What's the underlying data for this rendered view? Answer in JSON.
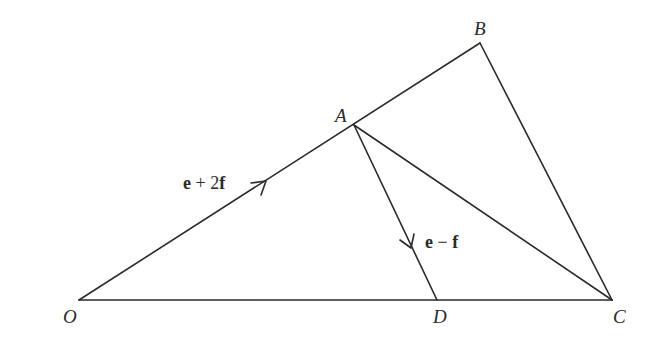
{
  "diagram": {
    "points": {
      "O": {
        "label": "O",
        "x": 79,
        "y": 300,
        "label_x": 63,
        "label_y": 323
      },
      "A": {
        "label": "A",
        "x": 354,
        "y": 125,
        "label_x": 335,
        "label_y": 122
      },
      "B": {
        "label": "B",
        "x": 480,
        "y": 43,
        "label_x": 474,
        "label_y": 35
      },
      "C": {
        "label": "C",
        "x": 612,
        "y": 300,
        "label_x": 613,
        "label_y": 323
      },
      "D": {
        "label": "D",
        "x": 437,
        "y": 300,
        "label_x": 433,
        "label_y": 323
      }
    },
    "segments": [
      {
        "name": "OB",
        "from": "O",
        "to": "B"
      },
      {
        "name": "BC",
        "from": "B",
        "to": "C"
      },
      {
        "name": "OC",
        "from": "O",
        "to": "C"
      },
      {
        "name": "AC",
        "from": "A",
        "to": "C"
      },
      {
        "name": "AD",
        "from": "A",
        "to": "D"
      }
    ],
    "vectors": [
      {
        "name": "OA",
        "from": "O",
        "to": "A",
        "label": "e + 2f",
        "label_parts": [
          "e",
          " + 2",
          "f"
        ],
        "arrow_at": [
          266,
          181
        ]
      },
      {
        "name": "AD",
        "from": "A",
        "to": "D",
        "label": "e − f",
        "label_parts": [
          "e",
          " − ",
          "f"
        ],
        "arrow_at": [
          411,
          248
        ]
      }
    ],
    "stroke_color": "#2a2a2a",
    "background": "#ffffff"
  }
}
